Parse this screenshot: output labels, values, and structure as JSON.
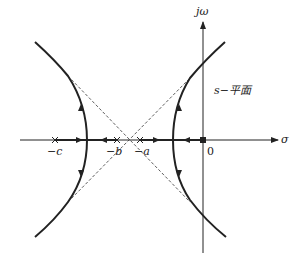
{
  "diagram": {
    "type": "root-locus",
    "plane_label": "s−平面",
    "axes": {
      "real_label": "σ",
      "imag_label": "jω",
      "origin_label": "0"
    },
    "poles": [
      {
        "label": "−c",
        "x": 55
      },
      {
        "label": "−b",
        "x": 117
      },
      {
        "label": "−a",
        "x": 140
      },
      {
        "label": "",
        "x": 203
      }
    ],
    "asymptote_center_x": 128,
    "colors": {
      "line": "#222222",
      "dashed": "#333333",
      "background": "#ffffff"
    }
  }
}
